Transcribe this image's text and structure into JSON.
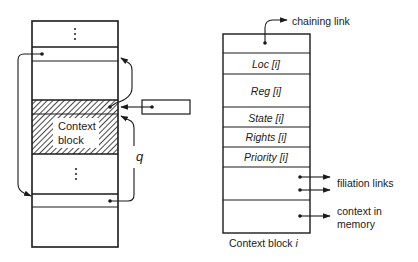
{
  "left_stack": {
    "ellipsis_top": "⋮",
    "ellipsis_bottom": "⋮",
    "context_block_label_line1": "Context",
    "context_block_label_line2": "block",
    "q_label": "q"
  },
  "right_block": {
    "fields": [
      {
        "name": "chaining",
        "label": ""
      },
      {
        "name": "loc",
        "label": "Loc [i]"
      },
      {
        "name": "reg",
        "label": "Reg [i]"
      },
      {
        "name": "state",
        "label": "State [i]"
      },
      {
        "name": "rights",
        "label": "Rights [i]"
      },
      {
        "name": "priority",
        "label": "Priority [i]"
      },
      {
        "name": "filiation",
        "label": ""
      },
      {
        "name": "context-memory",
        "label": ""
      }
    ],
    "chaining_link_label": "chaining link",
    "filiation_links_label": "filiation links",
    "context_in_memory_line1": "context in",
    "context_in_memory_line2": "memory",
    "caption_prefix": "Context block ",
    "caption_index": "i"
  },
  "colors": {
    "stroke": "#1a1a1a",
    "background": "#ffffff"
  }
}
